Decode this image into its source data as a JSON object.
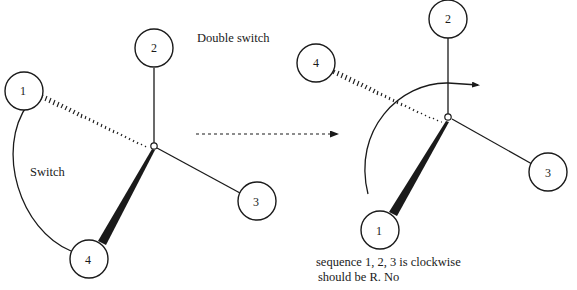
{
  "title": "Double switch",
  "transition_arrow": "dotted-right-arrow",
  "left_molecule": {
    "center_label": "C",
    "atoms": [
      {
        "id": "1",
        "label": "1",
        "bond": "hashed-wedge"
      },
      {
        "id": "2",
        "label": "2",
        "bond": "single"
      },
      {
        "id": "3",
        "label": "3",
        "bond": "single"
      },
      {
        "id": "4",
        "label": "4",
        "bond": "solid-wedge"
      }
    ],
    "operation_label": "Switch",
    "operation": "swap atoms 1 and 4"
  },
  "right_molecule": {
    "center_label": "C",
    "atoms": [
      {
        "id": "1",
        "label": "1",
        "bond": "solid-wedge"
      },
      {
        "id": "2",
        "label": "2",
        "bond": "single"
      },
      {
        "id": "3",
        "label": "3",
        "bond": "single"
      },
      {
        "id": "4",
        "label": "4",
        "bond": "hashed-wedge"
      }
    ],
    "rotation": "clockwise-arc-arrow"
  },
  "caption": {
    "line1": "sequence 1, 2, 3 is clockwise",
    "line2": "should be R. No"
  }
}
